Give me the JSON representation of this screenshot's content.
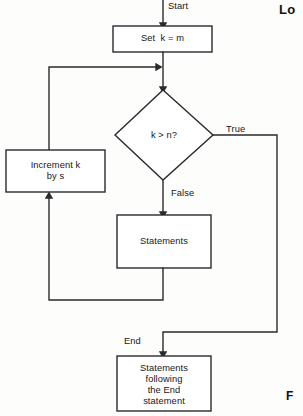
{
  "figure": {
    "title_fragment_top_right": "Lo",
    "caption_fragment_bottom_right": "F",
    "background_color": "#fdfdfc",
    "line_color": "#2a2a2e",
    "text_color": "#16161a"
  },
  "nodes": {
    "set_k": {
      "label": "Set  k = m",
      "shape": "process"
    },
    "decision": {
      "label": "k > n?",
      "shape": "decision"
    },
    "increment": {
      "label": "Increment k\nby s",
      "shape": "process"
    },
    "statements": {
      "label": "Statements",
      "shape": "process"
    },
    "final_statements": {
      "label": "Statements\nfollowing\nthe End\nstatement",
      "shape": "process"
    }
  },
  "edge_labels": {
    "start": "Start",
    "true": "True",
    "false": "False",
    "end": "End"
  }
}
